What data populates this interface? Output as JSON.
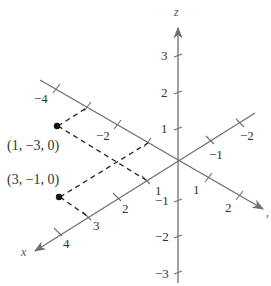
{
  "diagram": {
    "type": "3d-coordinate-axes",
    "axes": {
      "x": {
        "label": "x",
        "tick_labels": [
          "4",
          "3",
          "2",
          "1",
          "-1",
          "-2"
        ]
      },
      "y": {
        "label": "y",
        "tick_labels": [
          "-4",
          "-2",
          "1",
          "2"
        ]
      },
      "z": {
        "label": "z",
        "tick_labels": [
          "3",
          "2",
          "1",
          "-1",
          "-2",
          "-3"
        ]
      }
    },
    "points": [
      {
        "label": "(1, −3, 0)",
        "coords": [
          1,
          -3,
          0
        ]
      },
      {
        "label": "(3, −1, 0)",
        "coords": [
          3,
          -1,
          0
        ]
      }
    ],
    "labels": {
      "z_axis": "z",
      "x_axis": "x",
      "y_axis": ",",
      "x_4": "4",
      "x_3": "3",
      "x_2": "2",
      "x_1": "1",
      "x_m1": "−1",
      "x_m2": "−2",
      "y_m4": "−4",
      "y_m2": "−2",
      "y_1": "1",
      "y_2": "2",
      "z_3": "3",
      "z_2": "2",
      "z_1": "1",
      "z_m1": "−1",
      "z_m2": "−2",
      "z_m3": "−3",
      "p1": "(1, −3, 0)",
      "p2": "(3, −1, 0)"
    },
    "colors": {
      "axis": "#6f6f6f",
      "point": "#111111",
      "dashed": "#222222",
      "text": "#333333"
    }
  }
}
